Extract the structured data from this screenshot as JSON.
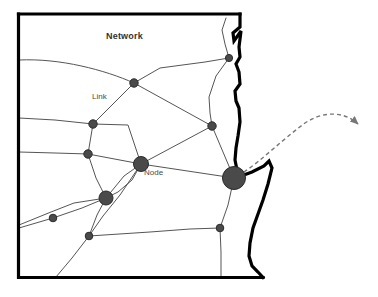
{
  "figure": {
    "title": "Network",
    "labels": {
      "link": "Link",
      "node": "Node"
    }
  },
  "colors": {
    "node_fill": "#4a4a4a",
    "node_stroke": "#2b2b2b",
    "link_stroke": "#555555",
    "border_stroke": "#000000",
    "coastline_stroke": "#000000",
    "arrow_stroke": "#777777",
    "background": "#ffffff",
    "text": "#333333"
  },
  "diagram": {
    "type": "network-map",
    "border": {
      "name": "state-boundary",
      "stroke_width": 3.2,
      "path": "M 18.5 14 L 18.5 277.5 L 263 277.5"
    },
    "coastline": {
      "name": "coastline",
      "stroke_width": 3.2,
      "path": "M 240 14 L 240 27 L 233 33 L 234 41 L 241 31 L 239 47 L 240 57 L 236 64 L 239 72 L 240 84 L 235 91 L 236 101 L 239 108 L 240 122 L 238 136 L 236 148 L 235 160 L 237 170 L 241 176 L 252 172 L 264 166 L 269 161 L 272 168 L 268 184 L 263 200 L 258 214 L 253 228 L 250 243 L 249 256 L 252 266 L 258 272 L 263 277.5"
    },
    "top_border": {
      "name": "top-boundary",
      "stroke_width": 3.2,
      "path": "M 18.5 14 L 240 14"
    },
    "nodes": [
      {
        "id": "n1",
        "name": "node-upper-right",
        "cx": 229,
        "cy": 58,
        "r": 3.6,
        "size": "small"
      },
      {
        "id": "n2",
        "name": "node-upper-center",
        "cx": 134,
        "cy": 83,
        "r": 4.2,
        "size": "small"
      },
      {
        "id": "n3",
        "name": "node-left-upper",
        "cx": 93,
        "cy": 124,
        "r": 4.2,
        "size": "small"
      },
      {
        "id": "n4",
        "name": "node-right-mid",
        "cx": 212,
        "cy": 126,
        "r": 4.2,
        "size": "small"
      },
      {
        "id": "n5",
        "name": "node-left-mid",
        "cx": 88,
        "cy": 154,
        "r": 4.2,
        "size": "small"
      },
      {
        "id": "n6",
        "name": "node-center-hub",
        "cx": 141,
        "cy": 164,
        "r": 7.5,
        "size": "medium"
      },
      {
        "id": "n7",
        "name": "node-major-coastal",
        "cx": 234,
        "cy": 178,
        "r": 11.5,
        "size": "large"
      },
      {
        "id": "n8",
        "name": "node-lower-hub",
        "cx": 106,
        "cy": 198,
        "r": 7.0,
        "size": "medium"
      },
      {
        "id": "n9",
        "name": "node-lower-left",
        "cx": 53,
        "cy": 218,
        "r": 3.8,
        "size": "small"
      },
      {
        "id": "n10",
        "name": "node-lower-center",
        "cx": 89,
        "cy": 236,
        "r": 3.8,
        "size": "small"
      },
      {
        "id": "n11",
        "name": "node-lower-right",
        "cx": 220,
        "cy": 228,
        "r": 3.8,
        "size": "small"
      }
    ],
    "links": [
      {
        "name": "link-west-edge-to-upper-center",
        "path": "M 19 60 C 60 58 105 70 134 83"
      },
      {
        "name": "link-upper-center-to-upper-right",
        "path": "M 134 83 L 160 68 L 205 62 L 229 58"
      },
      {
        "name": "link-upper-center-to-left-upper",
        "path": "M 134 83 L 93 124"
      },
      {
        "name": "link-upper-center-to-right-mid",
        "path": "M 134 83 L 212 126"
      },
      {
        "name": "link-upper-right-to-coast-south",
        "path": "M 229 58 L 216 76 L 209 97 L 210 113 L 212 126"
      },
      {
        "name": "link-upper-right-to-coast-north",
        "path": "M 229 58 L 225 44 L 222 30 L 226 18"
      },
      {
        "name": "link-right-mid-to-major",
        "path": "M 212 126 L 234 178"
      },
      {
        "name": "link-right-mid-to-center-hub",
        "path": "M 212 126 L 141 164"
      },
      {
        "name": "link-west-edge-to-left-upper",
        "path": "M 19 118 L 55 120 L 93 124"
      },
      {
        "name": "link-left-upper-to-left-mid",
        "path": "M 93 124 L 88 154"
      },
      {
        "name": "link-left-upper-to-center-hub",
        "path": "M 93 124 L 128 125 L 141 164"
      },
      {
        "name": "link-west-edge-to-left-mid",
        "path": "M 19 152 L 55 153 L 88 154"
      },
      {
        "name": "link-left-mid-to-center-hub",
        "path": "M 88 154 L 141 164"
      },
      {
        "name": "link-left-mid-to-lower-hub",
        "path": "M 88 154 L 96 178 L 106 198"
      },
      {
        "name": "link-center-hub-to-major",
        "path": "M 141 164 L 234 178"
      },
      {
        "name": "link-center-hub-to-lower-hub",
        "path": "M 141 164 L 132 180 L 118 192 L 106 198"
      },
      {
        "name": "link-center-hub-to-lower-center",
        "path": "M 141 164 L 120 195 L 103 216 L 89 236"
      },
      {
        "name": "link-lower-hub-to-lower-left",
        "path": "M 106 198 L 82 208 L 53 218"
      },
      {
        "name": "link-lower-left-to-west-edge",
        "path": "M 53 218 L 19 228"
      },
      {
        "name": "link-lower-hub-to-west-spur",
        "path": "M 106 198 L 74 203 L 51 212 L 19 225"
      },
      {
        "name": "link-lower-hub-to-lower-center",
        "path": "M 106 198 L 97 215 L 89 236"
      },
      {
        "name": "link-lower-center-to-bottom",
        "path": "M 89 236 L 72 258 L 56 277"
      },
      {
        "name": "link-lower-center-to-lower-right",
        "path": "M 89 236 L 150 232 L 190 229 L 220 228"
      },
      {
        "name": "link-lower-right-to-major",
        "path": "M 220 228 L 228 205 L 234 178"
      },
      {
        "name": "link-lower-right-to-bottom",
        "path": "M 220 228 L 221 252 L 221 277"
      },
      {
        "name": "link-lower-hub-to-upper-right-long",
        "path": "M 106 198 L 124 176 L 141 164"
      }
    ],
    "arrow": {
      "name": "outbound-flow-arrow",
      "style": "dashed",
      "path": "M 244 172 C 262 160 282 140 305 123 C 325 110 345 112 358 124",
      "dash": "4 3",
      "stroke_width": 1.4,
      "arrowhead": {
        "x": 364,
        "y": 122,
        "angle": 28
      }
    }
  }
}
